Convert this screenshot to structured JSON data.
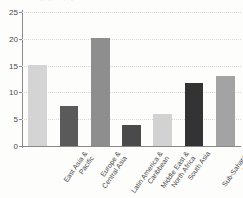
{
  "chart_data": {
    "type": "bar",
    "title": "",
    "xlabel": "",
    "ylabel": "",
    "ylim": [
      0,
      25
    ],
    "yticks": [
      0,
      5,
      10,
      15,
      20,
      25
    ],
    "grid": true,
    "legend": null,
    "categories": [
      "East Asia & Pacific",
      "Europe & Central Asia",
      "Latin America & Caribbean",
      "Middle East & North Africa",
      "South Asia",
      "Sub-Saharan Africa",
      "High-income"
    ],
    "category_lines": [
      [
        "East Asia &",
        "Pacific"
      ],
      [
        "Europe &",
        "Central Asia"
      ],
      [
        "Latin America &",
        "Caribbean"
      ],
      [
        "Middle East &",
        "North Africa"
      ],
      [
        "South Asia",
        ""
      ],
      [
        "Sub-Saharan",
        "Africa"
      ],
      [
        "High-income",
        ""
      ]
    ],
    "values": [
      15.1,
      7.5,
      20.1,
      4.0,
      6.0,
      11.8,
      13.1
    ],
    "bar_colors": [
      "#d4d4d4",
      "#5a5a5a",
      "#8e8e8e",
      "#4a4a4a",
      "#d2d2d2",
      "#333333",
      "#a3a3a3"
    ]
  },
  "axes": {
    "y_tick_labels": [
      "0",
      "5",
      "10",
      "15",
      "20",
      "25"
    ],
    "axis_color": "#8a8a8a",
    "grid_color": "#d8d8d8"
  },
  "title_remnant": "'',   ,   '',   ,'"
}
